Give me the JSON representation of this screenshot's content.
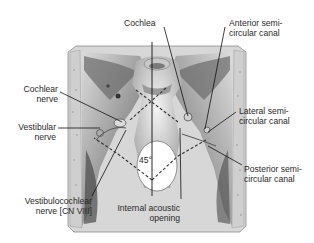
{
  "diagram": {
    "labels": {
      "cochlea": {
        "line1": "Cochlea"
      },
      "anterior_canal": {
        "line1": "Anterior semi-",
        "line2": "circular canal"
      },
      "cochlear_nerve": {
        "line1": "Cochlear",
        "line2": "nerve"
      },
      "vestibular_nerve": {
        "line1": "Vestibular",
        "line2": "nerve"
      },
      "lateral_canal": {
        "line1": "Lateral semi-",
        "line2": "circular canal"
      },
      "posterior_canal": {
        "line1": "Posterior semi-",
        "line2": "circular canal"
      },
      "vestibulocochlear": {
        "line1": "Vestibulocochlear",
        "line2": "nerve [CN VIII]"
      },
      "internal_acoustic": {
        "line1": "Internal acoustic",
        "line2": "opening"
      }
    },
    "angle_annotation": "45°",
    "colors": {
      "background": "#ffffff",
      "bone_light": "#e6e6e6",
      "bone_mid": "#b5b5b5",
      "bone_dark": "#555555",
      "leader_line": "#222222",
      "text": "#2a2a2a"
    }
  }
}
